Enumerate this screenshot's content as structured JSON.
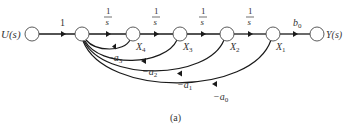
{
  "diagram": {
    "type": "signal-flow-graph",
    "caption": "(a)",
    "input_label": "U(s)",
    "output_label": "Y(s)",
    "nodes": [
      {
        "id": "u",
        "label": "U(s)"
      },
      {
        "id": "e",
        "label": ""
      },
      {
        "id": "x4",
        "label": "X",
        "sub": "4"
      },
      {
        "id": "x3",
        "label": "X",
        "sub": "3"
      },
      {
        "id": "x2",
        "label": "X",
        "sub": "2"
      },
      {
        "id": "x1",
        "label": "X",
        "sub": "1"
      },
      {
        "id": "y",
        "label": "Y(s)"
      }
    ],
    "forward_gains": {
      "u_e": "1",
      "integrator_num": "1",
      "integrator_den": "s",
      "x1_y": "b",
      "x1_y_sub": "0"
    },
    "feedback_gains": [
      {
        "from": "X4",
        "label": "−a",
        "sub": "3"
      },
      {
        "from": "X3",
        "label": "−a",
        "sub": "2"
      },
      {
        "from": "X2",
        "label": "−a",
        "sub": "1"
      },
      {
        "from": "X1",
        "label": "−a",
        "sub": "0"
      }
    ]
  }
}
